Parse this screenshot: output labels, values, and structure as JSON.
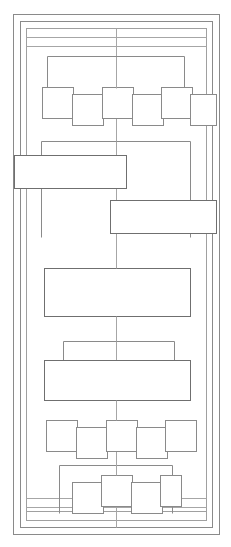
{
  "diagram": {
    "type": "schematic-line-drawing",
    "canvas": {
      "width": 231,
      "height": 547,
      "background": "#ffffff"
    },
    "stroke": {
      "color": "#8a8a8a",
      "color_dark": "#6f6f6f",
      "color_light": "#a6a6a6",
      "width_frame": "1",
      "width_box": "1",
      "width_connector": "1"
    },
    "frames": [
      {
        "name": "frame-outer",
        "x": 13,
        "y": 14,
        "width": 206,
        "height": 520,
        "stroke": "#8a8a8a"
      },
      {
        "name": "frame-mid",
        "x": 20,
        "y": 21,
        "width": 192,
        "height": 506,
        "stroke": "#8a8a8a"
      },
      {
        "name": "frame-inner",
        "x": 26,
        "y": 28,
        "width": 180,
        "height": 492,
        "stroke": "#a0a0a0"
      },
      {
        "name": "frame-core",
        "x": 26,
        "y": 37,
        "width": 180,
        "height": 474,
        "stroke": "#a0a0a0"
      }
    ],
    "spine": {
      "name": "vertical-spine",
      "x": 116,
      "y_top": 28,
      "y_bottom": 527
    },
    "brackets": [
      {
        "name": "bracket-top",
        "left": 47,
        "right": 184,
        "y": 56,
        "drop": 34
      },
      {
        "name": "bracket-upper-mid",
        "left": 41,
        "right": 190,
        "y": 141,
        "drop": 96
      },
      {
        "name": "bracket-lower-mid",
        "left": 63,
        "right": 174,
        "y": 341,
        "drop": 20
      },
      {
        "name": "bracket-bottom",
        "left": 59,
        "right": 172,
        "y": 465,
        "drop": 48
      }
    ],
    "wide_rects": [
      {
        "name": "offset-rect-left",
        "x": 14,
        "y": 155,
        "width": 112,
        "height": 33
      },
      {
        "name": "offset-rect-right",
        "x": 110,
        "y": 200,
        "width": 106,
        "height": 33
      },
      {
        "name": "center-rect-large",
        "x": 44,
        "y": 268,
        "width": 146,
        "height": 48
      },
      {
        "name": "center-rect-wide",
        "x": 44,
        "y": 360,
        "width": 146,
        "height": 40
      }
    ],
    "zigzag_rows": [
      {
        "name": "zigzag-row-top",
        "boxes": [
          {
            "name": "box-1",
            "x": 42,
            "y": 87,
            "width": 31,
            "height": 31
          },
          {
            "name": "box-2",
            "x": 72,
            "y": 94,
            "width": 31,
            "height": 31
          },
          {
            "name": "box-3",
            "x": 102,
            "y": 87,
            "width": 31,
            "height": 31
          },
          {
            "name": "box-4",
            "x": 132,
            "y": 94,
            "width": 31,
            "height": 31
          },
          {
            "name": "box-5",
            "x": 161,
            "y": 87,
            "width": 31,
            "height": 31
          },
          {
            "name": "box-6",
            "x": 190,
            "y": 94,
            "width": 26,
            "height": 31
          }
        ]
      },
      {
        "name": "zigzag-row-bottom",
        "boxes": [
          {
            "name": "box-1",
            "x": 46,
            "y": 420,
            "width": 31,
            "height": 31
          },
          {
            "name": "box-2",
            "x": 76,
            "y": 427,
            "width": 31,
            "height": 31
          },
          {
            "name": "box-3",
            "x": 106,
            "y": 420,
            "width": 31,
            "height": 31
          },
          {
            "name": "box-4",
            "x": 136,
            "y": 427,
            "width": 31,
            "height": 31
          },
          {
            "name": "box-5",
            "x": 165,
            "y": 420,
            "width": 31,
            "height": 31
          }
        ]
      },
      {
        "name": "zigzag-row-last",
        "boxes": [
          {
            "name": "box-1",
            "x": 72,
            "y": 482,
            "width": 31,
            "height": 31
          },
          {
            "name": "box-2",
            "x": 101,
            "y": 475,
            "width": 31,
            "height": 31
          },
          {
            "name": "box-3",
            "x": 131,
            "y": 482,
            "width": 31,
            "height": 31
          },
          {
            "name": "box-4",
            "x": 160,
            "y": 475,
            "width": 21,
            "height": 31
          }
        ]
      }
    ],
    "rails": [
      {
        "name": "rail-top-1",
        "x1": 26,
        "y1": 37,
        "x2": 206,
        "y2": 37
      },
      {
        "name": "rail-top-2",
        "x1": 26,
        "y1": 46,
        "x2": 206,
        "y2": 46
      },
      {
        "name": "rail-bottom-1",
        "x1": 26,
        "y1": 498,
        "x2": 206,
        "y2": 498
      },
      {
        "name": "rail-bottom-2",
        "x1": 26,
        "y1": 507,
        "x2": 206,
        "y2": 507
      }
    ]
  }
}
